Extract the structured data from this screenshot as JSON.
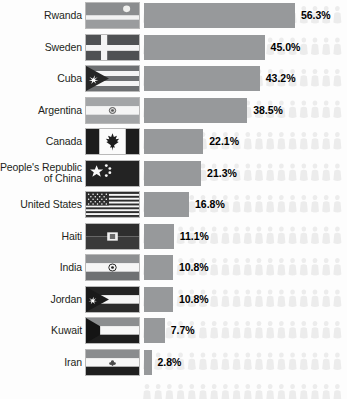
{
  "chart_data": {
    "type": "bar",
    "orientation": "horizontal",
    "title": "",
    "xlabel": "",
    "ylabel": "",
    "grid": false,
    "legend": false,
    "xlim": [
      0,
      60
    ],
    "value_suffix": "%",
    "categories": [
      "Rwanda",
      "Sweden",
      "Cuba",
      "Argentina",
      "Canada",
      "People's Republic of China",
      "United States",
      "Haiti",
      "India",
      "Jordan",
      "Kuwait",
      "Iran"
    ],
    "values": [
      56.3,
      45.0,
      43.2,
      38.5,
      22.1,
      21.3,
      16.8,
      11.1,
      10.8,
      10.8,
      7.7,
      2.8
    ],
    "value_labels": [
      "56.3%",
      "45.0%",
      "43.2%",
      "38.5%",
      "22.1%",
      "21.3%",
      "16.8%",
      "11.1%",
      "10.8%",
      "10.8%",
      "7.7%",
      "2.8%"
    ]
  },
  "colors": {
    "bar": "#97999b",
    "background": "#fdfdfd",
    "label_text": "#231f20",
    "value_text": "#000000",
    "people_icon": "#ececec"
  },
  "rows": [
    {
      "label": "Rwanda",
      "label_line1": "Rwanda",
      "label_line2": "",
      "value": 56.3,
      "value_label": "56.3%",
      "flag_name": "flag-rwanda"
    },
    {
      "label": "Sweden",
      "label_line1": "Sweden",
      "label_line2": "",
      "value": 45.0,
      "value_label": "45.0%",
      "flag_name": "flag-sweden"
    },
    {
      "label": "Cuba",
      "label_line1": "Cuba",
      "label_line2": "",
      "value": 43.2,
      "value_label": "43.2%",
      "flag_name": "flag-cuba"
    },
    {
      "label": "Argentina",
      "label_line1": "Argentina",
      "label_line2": "",
      "value": 38.5,
      "value_label": "38.5%",
      "flag_name": "flag-argentina"
    },
    {
      "label": "Canada",
      "label_line1": "Canada",
      "label_line2": "",
      "value": 22.1,
      "value_label": "22.1%",
      "flag_name": "flag-canada"
    },
    {
      "label": "People's Republic of China",
      "label_line1": "People's Republic",
      "label_line2": "of China",
      "value": 21.3,
      "value_label": "21.3%",
      "flag_name": "flag-china"
    },
    {
      "label": "United States",
      "label_line1": "United States",
      "label_line2": "",
      "value": 16.8,
      "value_label": "16.8%",
      "flag_name": "flag-united-states"
    },
    {
      "label": "Haiti",
      "label_line1": "Haiti",
      "label_line2": "",
      "value": 11.1,
      "value_label": "11.1%",
      "flag_name": "flag-haiti"
    },
    {
      "label": "India",
      "label_line1": "India",
      "label_line2": "",
      "value": 10.8,
      "value_label": "10.8%",
      "flag_name": "flag-india"
    },
    {
      "label": "Jordan",
      "label_line1": "Jordan",
      "label_line2": "",
      "value": 10.8,
      "value_label": "10.8%",
      "flag_name": "flag-jordan"
    },
    {
      "label": "Kuwait",
      "label_line1": "Kuwait",
      "label_line2": "",
      "value": 7.7,
      "value_label": "7.7%",
      "flag_name": "flag-kuwait"
    },
    {
      "label": "Iran",
      "label_line1": "Iran",
      "label_line2": "",
      "value": 2.8,
      "value_label": "2.8%",
      "flag_name": "flag-iran"
    }
  ],
  "layout": {
    "row_pitch": 31.5,
    "first_row_top": 1,
    "bar_left": 144,
    "px_per_percent": 2.68,
    "pct_gap": 6
  }
}
